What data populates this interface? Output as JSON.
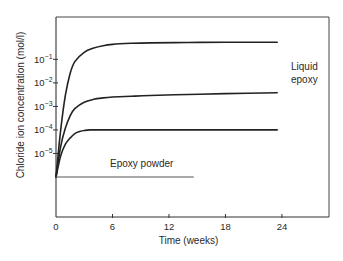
{
  "chart_data": {
    "type": "line",
    "title": "",
    "xlabel": "Time (weeks)",
    "ylabel": "Chloride ion concentration (mol/l)",
    "x_scale": "linear",
    "y_scale": "log",
    "xlim": [
      0,
      29
    ],
    "ylim_log10": [
      -7.7,
      0.8
    ],
    "x_ticks": [
      0,
      6,
      12,
      18,
      24
    ],
    "x_tick_labels": [
      "0",
      "6",
      "12",
      "18",
      "24"
    ],
    "y_ticks_log10": [
      -1,
      -2,
      -3,
      -4,
      -5
    ],
    "y_tick_labels": [
      {
        "base": "10",
        "exp": "−1"
      },
      {
        "base": "10",
        "exp": "−2"
      },
      {
        "base": "10",
        "exp": "−3"
      },
      {
        "base": "10",
        "exp": "−4"
      },
      {
        "base": "10",
        "exp": "−5"
      }
    ],
    "grid": false,
    "legend": "none",
    "series": [
      {
        "name": "Liquid epoxy (upper)",
        "x": [
          0,
          0.5,
          1,
          1.5,
          2,
          3,
          4,
          5,
          6,
          8,
          10,
          14,
          18,
          23.5
        ],
        "y": [
          1e-06,
          0.0001,
          0.003,
          0.025,
          0.08,
          0.2,
          0.3,
          0.38,
          0.43,
          0.48,
          0.5,
          0.52,
          0.53,
          0.53
        ]
      },
      {
        "name": "Liquid epoxy (middle)",
        "x": [
          0,
          0.5,
          1,
          1.5,
          2,
          3,
          4,
          5,
          6,
          8,
          10,
          14,
          18,
          23.5
        ],
        "y": [
          1e-06,
          2e-05,
          0.00012,
          0.0004,
          0.0008,
          0.0015,
          0.002,
          0.0023,
          0.0025,
          0.0027,
          0.0029,
          0.0032,
          0.0035,
          0.0038
        ]
      },
      {
        "name": "Liquid epoxy (lower)",
        "x": [
          0,
          0.5,
          1,
          1.5,
          2,
          2.5,
          3,
          3.6,
          5,
          8,
          12,
          18,
          23.5
        ],
        "y": [
          1e-06,
          8e-06,
          2.5e-05,
          4.5e-05,
          7e-05,
          8.5e-05,
          9.5e-05,
          0.0001,
          0.0001,
          0.0001,
          0.0001,
          0.0001,
          0.0001
        ]
      },
      {
        "name": "Epoxy powder",
        "x": [
          0,
          14.6
        ],
        "y": [
          1e-06,
          1e-06
        ]
      }
    ],
    "annotations": [
      {
        "text": "Liquid",
        "near": "middle series end, right side"
      },
      {
        "text": "epoxy",
        "near": "middle series end, right side"
      },
      {
        "text": "Epoxy powder",
        "near": "above Epoxy powder line"
      }
    ]
  }
}
